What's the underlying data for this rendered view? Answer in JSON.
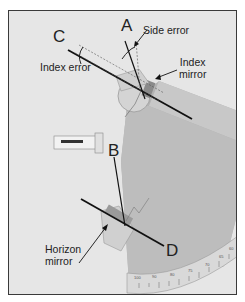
{
  "figure": {
    "labels": {
      "A": "A",
      "B": "B",
      "C": "C",
      "D": "D"
    },
    "annotations": {
      "side_error": "Side error",
      "index_error": "Index error",
      "index_mirror_line1": "Index",
      "index_mirror_line2": "mirror",
      "horizon_mirror_line1": "Horizon",
      "horizon_mirror_line2": "mirror"
    },
    "scale_ticks": [
      "100",
      "90",
      "80",
      "75",
      "70",
      "65",
      "60"
    ],
    "colors": {
      "background": "#e6e6e6",
      "frame": "#3a3a3a",
      "instrument_shadow": "#a9a9a9",
      "lines": "#111111"
    }
  }
}
